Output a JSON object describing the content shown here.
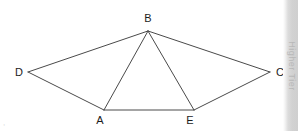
{
  "figure": {
    "type": "geometry-diagram",
    "background_color": "#ffffff",
    "stroke_color": "#4a4a4a",
    "stroke_width": 1,
    "label_color": "#1c1c1c",
    "points": [
      {
        "id": "B",
        "label": "B",
        "x": 148,
        "y": 31,
        "label_x": 148,
        "label_y": 13,
        "label_anchor": "above"
      },
      {
        "id": "D",
        "label": "D",
        "x": 28,
        "y": 72,
        "label_x": 15,
        "label_y": 67,
        "label_anchor": "left"
      },
      {
        "id": "C",
        "label": "C",
        "x": 270,
        "y": 72,
        "label_x": 276,
        "label_y": 67,
        "label_anchor": "right"
      },
      {
        "id": "A",
        "label": "A",
        "x": 104,
        "y": 110,
        "label_x": 100,
        "label_y": 115,
        "label_anchor": "below"
      },
      {
        "id": "E",
        "label": "E",
        "x": 194,
        "y": 110,
        "label_x": 190,
        "label_y": 115,
        "label_anchor": "below"
      }
    ],
    "segments": [
      {
        "id": "DB",
        "from": "D",
        "to": "B",
        "kind": "outline"
      },
      {
        "id": "BC",
        "from": "B",
        "to": "C",
        "kind": "outline"
      },
      {
        "id": "DA",
        "from": "D",
        "to": "A",
        "kind": "outline"
      },
      {
        "id": "AE",
        "from": "A",
        "to": "E",
        "kind": "outline"
      },
      {
        "id": "EC",
        "from": "E",
        "to": "C",
        "kind": "outline"
      },
      {
        "id": "BA",
        "from": "B",
        "to": "A",
        "kind": "interior"
      },
      {
        "id": "BE",
        "from": "B",
        "to": "E",
        "kind": "interior"
      }
    ]
  },
  "side_strip": {
    "text": "Higher Tier",
    "color": "#cfcfcf",
    "text_color": "#b4b4b4"
  },
  "corner_mark": {
    "text": ","
  }
}
